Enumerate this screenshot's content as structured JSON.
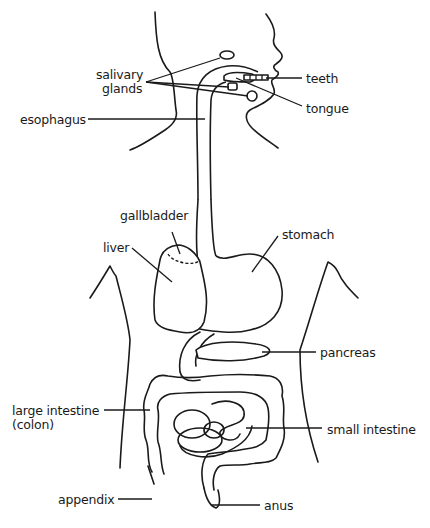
{
  "diagram": {
    "labels": {
      "salivary_glands_line1": "salivary",
      "salivary_glands_line2": "glands",
      "teeth": "teeth",
      "tongue": "tongue",
      "esophagus": "esophagus",
      "gallbladder": "gallbladder",
      "liver": "liver",
      "stomach": "stomach",
      "pancreas": "pancreas",
      "large_intestine_line1": "large intestine",
      "large_intestine_line2": "(colon)",
      "small_intestine": "small intestine",
      "appendix": "appendix",
      "anus": "anus"
    },
    "colors": {
      "line": "#1a1a1a",
      "background": "#ffffff"
    }
  }
}
